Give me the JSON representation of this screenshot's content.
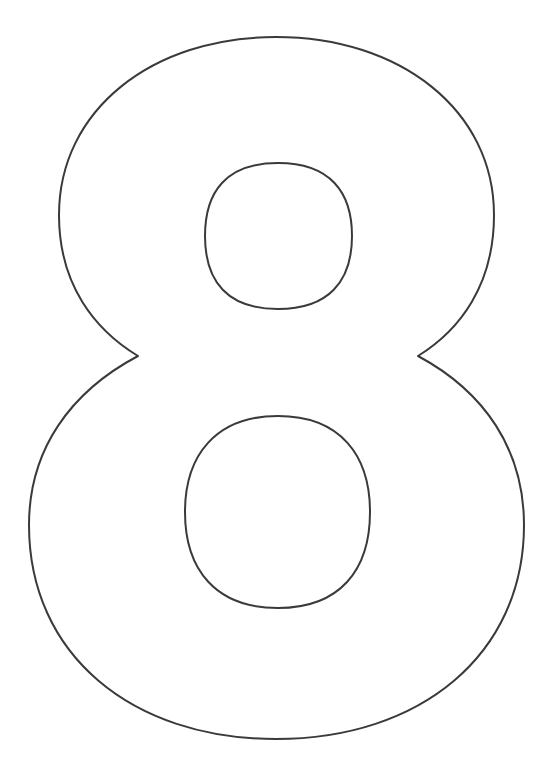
{
  "page": {
    "glyph": "8",
    "background_color": "#ffffff",
    "stroke_color": "#3a3a3a"
  }
}
